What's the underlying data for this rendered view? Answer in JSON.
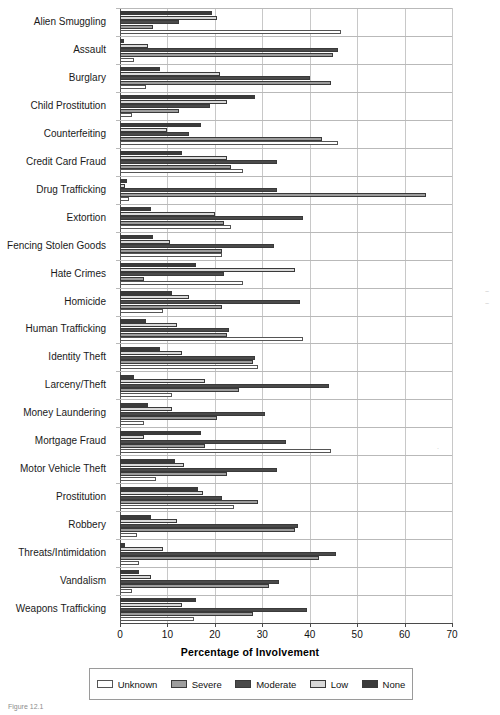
{
  "chart_data": {
    "type": "bar",
    "orientation": "horizontal",
    "title": "",
    "xlabel": "Percentage of Involvement",
    "ylabel": "",
    "xlim": [
      0,
      70
    ],
    "xticks": [
      0,
      10,
      20,
      30,
      40,
      50,
      60,
      70
    ],
    "grid": true,
    "legend_position": "bottom",
    "legend_entries": [
      "Unknown",
      "Severe",
      "Moderate",
      "Low",
      "None"
    ],
    "series_order_top_to_bottom": [
      "None",
      "Low",
      "Moderate",
      "Severe",
      "Unknown"
    ],
    "categories": [
      "Alien Smuggling",
      "Assault",
      "Burglary",
      "Child Prostitution",
      "Counterfeiting",
      "Credit Card Fraud",
      "Drug Trafficking",
      "Extortion",
      "Fencing Stolen Goods",
      "Hate Crimes",
      "Homicide",
      "Human Trafficking",
      "Identity Theft",
      "Larceny/Theft",
      "Money Laundering",
      "Mortgage Fraud",
      "Motor Vehicle Theft",
      "Prostitution",
      "Robbery",
      "Threats/Intimidation",
      "Vandalism",
      "Weapons Trafficking"
    ],
    "series": [
      {
        "name": "None",
        "color": "#3b3b3b",
        "values": [
          19.5,
          0.8,
          8.5,
          28.5,
          17.0,
          13.0,
          1.5,
          6.5,
          7.0,
          16.0,
          11.0,
          5.5,
          8.5,
          3.0,
          6.0,
          17.0,
          11.5,
          16.5,
          6.5,
          1.0,
          4.0,
          16.0
        ]
      },
      {
        "name": "Low",
        "color": "#d9d9d9",
        "values": [
          20.5,
          6.0,
          21.0,
          22.5,
          10.0,
          22.5,
          1.0,
          20.0,
          10.5,
          37.0,
          14.5,
          12.0,
          13.0,
          18.0,
          11.0,
          5.0,
          13.5,
          17.5,
          12.0,
          9.0,
          6.5,
          13.0
        ]
      },
      {
        "name": "Moderate",
        "color": "#4a4a4a",
        "values": [
          12.5,
          46.0,
          40.0,
          19.0,
          14.5,
          33.0,
          33.0,
          38.5,
          32.5,
          22.0,
          38.0,
          23.0,
          28.5,
          44.0,
          30.5,
          35.0,
          33.0,
          21.5,
          37.5,
          45.5,
          33.5,
          39.5
        ]
      },
      {
        "name": "Severe",
        "color": "#9d9d9d",
        "values": [
          7.0,
          45.0,
          44.5,
          12.5,
          42.5,
          23.5,
          64.5,
          22.0,
          21.5,
          5.0,
          21.5,
          22.5,
          28.0,
          25.0,
          20.5,
          18.0,
          22.5,
          29.0,
          37.0,
          42.0,
          31.5,
          28.0
        ]
      },
      {
        "name": "Unknown",
        "color": "#ffffff",
        "values": [
          46.5,
          3.0,
          5.5,
          2.5,
          46.0,
          26.0,
          2.0,
          23.5,
          21.5,
          26.0,
          9.0,
          38.5,
          29.0,
          11.0,
          5.0,
          44.5,
          7.5,
          24.0,
          3.5,
          4.0,
          2.5,
          15.5
        ]
      }
    ]
  },
  "axis": {
    "x_title": "Percentage of Involvement",
    "tick_labels": [
      "0",
      "10",
      "20",
      "30",
      "40",
      "50",
      "60",
      "70"
    ]
  },
  "legend": {
    "items": [
      {
        "label": "Unknown",
        "color": "#ffffff"
      },
      {
        "label": "Severe",
        "color": "#9d9d9d"
      },
      {
        "label": "Moderate",
        "color": "#4a4a4a"
      },
      {
        "label": "Low",
        "color": "#d9d9d9"
      },
      {
        "label": "None",
        "color": "#3b3b3b"
      }
    ]
  }
}
